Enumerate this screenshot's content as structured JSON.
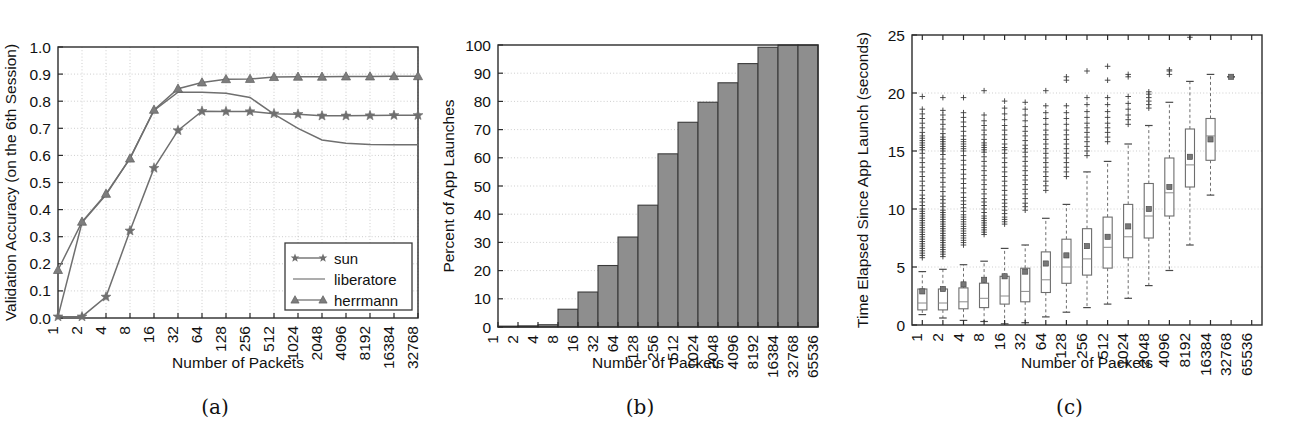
{
  "figure": {
    "panels": [
      {
        "id": "a",
        "caption": "(a)"
      },
      {
        "id": "b",
        "caption": "(b)"
      },
      {
        "id": "c",
        "caption": "(c)"
      }
    ]
  },
  "chart_data": [
    {
      "type": "line",
      "panel": "(a)",
      "title": "",
      "xlabel": "Number of Packets",
      "ylabel": "Validation Accuracy (on the 6th Session)",
      "xscale": "log2-categorical",
      "categories": [
        "1",
        "2",
        "4",
        "8",
        "16",
        "32",
        "64",
        "128",
        "256",
        "512",
        "1024",
        "2048",
        "4096",
        "8192",
        "16384",
        "32768"
      ],
      "yticklabels": [
        "0.0",
        "0.1",
        "0.2",
        "0.3",
        "0.4",
        "0.5",
        "0.6",
        "0.7",
        "0.8",
        "0.9",
        "1.0"
      ],
      "ylim": [
        0.0,
        1.0
      ],
      "grid": true,
      "legend_position": "lower right",
      "series": [
        {
          "name": "sun",
          "marker": "star",
          "color": "#6f6f6f",
          "values": [
            0.005,
            0.005,
            0.078,
            0.322,
            0.553,
            0.692,
            0.763,
            0.762,
            0.762,
            0.754,
            0.752,
            0.746,
            0.746,
            0.747,
            0.748,
            0.748
          ]
        },
        {
          "name": "liberatore",
          "marker": "none",
          "color": "#8a8a8a",
          "values": [
            0.005,
            0.352,
            0.455,
            0.59,
            0.766,
            0.833,
            0.833,
            0.829,
            0.814,
            0.752,
            0.7,
            0.657,
            0.645,
            0.64,
            0.639,
            0.639
          ]
        },
        {
          "name": "herrmann",
          "marker": "triangle",
          "color": "#7d7d7d",
          "values": [
            0.177,
            0.355,
            0.458,
            0.588,
            0.768,
            0.846,
            0.869,
            0.881,
            0.882,
            0.889,
            0.89,
            0.89,
            0.891,
            0.891,
            0.892,
            0.892
          ]
        }
      ]
    },
    {
      "type": "bar",
      "panel": "(b)",
      "title": "",
      "xlabel": "Number of Packets",
      "ylabel": "Percent of App Launches",
      "xscale": "log2-categorical",
      "categories": [
        "1",
        "2",
        "4",
        "8",
        "16",
        "32",
        "64",
        "128",
        "256",
        "512",
        "1024",
        "2048",
        "4096",
        "8192",
        "16384",
        "32768",
        "65536"
      ],
      "yticklabels": [
        "0",
        "10",
        "20",
        "30",
        "40",
        "50",
        "60",
        "70",
        "80",
        "90",
        "100"
      ],
      "ylim": [
        0,
        100
      ],
      "grid": true,
      "values": [
        0.3,
        0.4,
        0.8,
        6.3,
        12.4,
        21.8,
        31.9,
        43.2,
        61.4,
        72.6,
        79.7,
        86.6,
        93.4,
        99.2,
        100.0,
        100.0,
        100.0
      ],
      "bar_fill": "#8e8e8e",
      "bar_edge": "#3a3a3a"
    },
    {
      "type": "boxplot",
      "panel": "(c)",
      "title": "",
      "xlabel": "Number of Packets",
      "ylabel": "Time Elapsed Since App Launch (seconds)",
      "xscale": "log2-categorical",
      "categories": [
        "1",
        "2",
        "4",
        "8",
        "16",
        "32",
        "64",
        "128",
        "256",
        "512",
        "1024",
        "2048",
        "4096",
        "8192",
        "16384",
        "32768",
        "65536"
      ],
      "yticklabels": [
        "0",
        "5",
        "10",
        "15",
        "20",
        "25"
      ],
      "ylim": [
        0,
        25
      ],
      "grid": true,
      "boxes": [
        {
          "category": "1",
          "whisker_low": 0.9,
          "q1": 1.3,
          "median": 1.9,
          "q3": 3.1,
          "whisker_high": 4.6,
          "mean": 2.9,
          "outliers": [
            5.8,
            6.0,
            6.2,
            6.4,
            6.6,
            6.8,
            7.0,
            7.2,
            7.4,
            7.6,
            7.8,
            8.0,
            8.2,
            8.4,
            8.6,
            8.8,
            9.0,
            9.2,
            9.4,
            9.6,
            9.8,
            10.0,
            10.3,
            10.6,
            10.9,
            11.2,
            11.6,
            12.0,
            12.4,
            12.8,
            13.2,
            13.6,
            14.0,
            14.4,
            14.8,
            15.1,
            15.3,
            15.5,
            15.7,
            15.9,
            16.1,
            16.3,
            16.6,
            17.0,
            17.4,
            17.8,
            18.2,
            18.6,
            19.7
          ]
        },
        {
          "category": "2",
          "whisker_low": 0.6,
          "q1": 1.3,
          "median": 1.9,
          "q3": 3.1,
          "whisker_high": 4.8,
          "mean": 3.1,
          "outliers": [
            5.9,
            6.1,
            6.3,
            6.5,
            6.7,
            6.9,
            7.1,
            7.3,
            7.5,
            7.7,
            7.9,
            8.1,
            8.3,
            8.5,
            8.7,
            8.9,
            9.1,
            9.3,
            9.5,
            9.7,
            9.9,
            10.2,
            10.5,
            10.8,
            11.1,
            11.5,
            11.9,
            12.3,
            12.7,
            13.1,
            13.5,
            13.9,
            14.3,
            14.7,
            15.0,
            15.2,
            15.4,
            15.6,
            15.8,
            16.0,
            16.2,
            16.5,
            16.9,
            17.3,
            17.7,
            18.1,
            18.5,
            19.6
          ]
        },
        {
          "category": "4",
          "whisker_low": 0.4,
          "q1": 1.4,
          "median": 2.0,
          "q3": 3.2,
          "whisker_high": 5.2,
          "mean": 3.5,
          "outliers": [
            6.9,
            7.1,
            7.3,
            7.5,
            7.7,
            7.9,
            8.1,
            8.3,
            8.5,
            8.7,
            8.9,
            9.1,
            9.3,
            9.5,
            9.8,
            10.1,
            10.4,
            10.7,
            11.0,
            11.4,
            11.8,
            12.2,
            12.6,
            13.0,
            13.4,
            13.8,
            14.2,
            14.6,
            15.0,
            15.2,
            15.4,
            15.6,
            15.8,
            16.0,
            16.3,
            16.7,
            17.1,
            17.5,
            17.9,
            18.3,
            19.6
          ]
        },
        {
          "category": "8",
          "whisker_low": 0.3,
          "q1": 1.5,
          "median": 2.3,
          "q3": 3.6,
          "whisker_high": 5.5,
          "mean": 3.9,
          "outliers": [
            7.8,
            8.0,
            8.2,
            8.4,
            8.6,
            8.8,
            9.0,
            9.2,
            9.4,
            9.7,
            10.0,
            10.3,
            10.6,
            10.9,
            11.3,
            11.7,
            12.1,
            12.5,
            12.9,
            13.3,
            13.7,
            14.1,
            14.5,
            14.9,
            15.1,
            15.3,
            15.5,
            15.7,
            16.0,
            16.4,
            16.8,
            17.2,
            17.6,
            18.1,
            20.2
          ]
        },
        {
          "category": "16",
          "whisker_low": 0.1,
          "q1": 1.8,
          "median": 2.5,
          "q3": 4.2,
          "whisker_high": 6.6,
          "mean": 4.2,
          "outliers": [
            8.7,
            8.9,
            9.1,
            9.3,
            9.6,
            9.9,
            10.2,
            10.5,
            10.8,
            11.2,
            11.6,
            12.0,
            12.4,
            12.8,
            13.2,
            13.6,
            14.0,
            14.4,
            14.8,
            15.1,
            15.3,
            15.6,
            16.0,
            16.4,
            16.8,
            17.2,
            17.7,
            18.2,
            18.7,
            19.3
          ]
        },
        {
          "category": "32",
          "whisker_low": 0.2,
          "q1": 2.0,
          "median": 2.9,
          "q3": 4.9,
          "whisker_high": 6.9,
          "mean": 4.6,
          "outliers": [
            9.9,
            10.2,
            10.5,
            10.9,
            11.3,
            11.7,
            12.1,
            12.5,
            12.9,
            13.3,
            13.7,
            14.1,
            14.5,
            14.9,
            15.2,
            15.5,
            15.9,
            16.3,
            16.7,
            17.1,
            17.6,
            18.1,
            18.6,
            19.2
          ]
        },
        {
          "category": "64",
          "whisker_low": 0.7,
          "q1": 2.8,
          "median": 3.9,
          "q3": 6.3,
          "whisker_high": 9.2,
          "mean": 5.3,
          "outliers": [
            11.6,
            12.0,
            12.4,
            12.8,
            13.2,
            13.6,
            14.0,
            14.4,
            14.8,
            15.2,
            15.6,
            16.0,
            16.4,
            16.8,
            17.3,
            17.8,
            18.3,
            18.9,
            20.2
          ]
        },
        {
          "category": "128",
          "whisker_low": 1.1,
          "q1": 3.6,
          "median": 5.0,
          "q3": 7.4,
          "whisker_high": 10.4,
          "mean": 6.0,
          "outliers": [
            12.8,
            13.2,
            13.6,
            14.0,
            14.4,
            14.8,
            15.2,
            15.6,
            16.0,
            16.4,
            16.8,
            17.3,
            17.8,
            18.3,
            18.9,
            21.1,
            21.4
          ]
        },
        {
          "category": "256",
          "whisker_low": 1.5,
          "q1": 4.3,
          "median": 5.7,
          "q3": 8.3,
          "whisker_high": 13.2,
          "mean": 6.8,
          "outliers": [
            14.6,
            15.0,
            15.4,
            15.8,
            16.2,
            16.6,
            17.0,
            17.4,
            17.9,
            18.4,
            19.0,
            19.6,
            21.9
          ]
        },
        {
          "category": "512",
          "whisker_low": 1.8,
          "q1": 4.9,
          "median": 6.7,
          "q3": 9.3,
          "whisker_high": 14.1,
          "mean": 7.6,
          "outliers": [
            15.8,
            16.2,
            16.6,
            17.0,
            17.4,
            17.9,
            18.4,
            19.0,
            19.6,
            21.1,
            22.3
          ]
        },
        {
          "category": "1024",
          "whisker_low": 2.3,
          "q1": 5.8,
          "median": 7.6,
          "q3": 10.4,
          "whisker_high": 15.6,
          "mean": 8.5,
          "outliers": [
            17.3,
            17.7,
            18.1,
            18.6,
            19.1,
            19.7,
            21.4,
            21.6
          ]
        },
        {
          "category": "2048",
          "whisker_low": 3.4,
          "q1": 7.5,
          "median": 9.4,
          "q3": 12.2,
          "whisker_high": 17.2,
          "mean": 10.0,
          "outliers": [
            18.7,
            19.0,
            19.3,
            19.6,
            19.9,
            20.1
          ]
        },
        {
          "category": "4096",
          "whisker_low": 4.7,
          "q1": 9.4,
          "median": 11.4,
          "q3": 14.4,
          "whisker_high": 19.2,
          "mean": 11.9,
          "outliers": [
            21.6,
            21.9,
            22.0
          ]
        },
        {
          "category": "8192",
          "whisker_low": 6.9,
          "q1": 11.9,
          "median": 13.8,
          "q3": 16.9,
          "whisker_high": 21.0,
          "mean": 14.5,
          "outliers": [
            24.8
          ]
        },
        {
          "category": "16384",
          "whisker_low": 11.2,
          "q1": 14.2,
          "median": 16.3,
          "q3": 17.8,
          "whisker_high": 21.6,
          "mean": 16.0,
          "outliers": []
        },
        {
          "category": "32768",
          "whisker_low": 21.4,
          "q1": 21.4,
          "median": 21.4,
          "q3": 21.4,
          "whisker_high": 21.4,
          "mean": 21.4,
          "outliers": []
        },
        {
          "category": "65536",
          "whisker_low": null,
          "q1": null,
          "median": null,
          "q3": null,
          "whisker_high": null,
          "mean": null,
          "outliers": []
        }
      ]
    }
  ]
}
